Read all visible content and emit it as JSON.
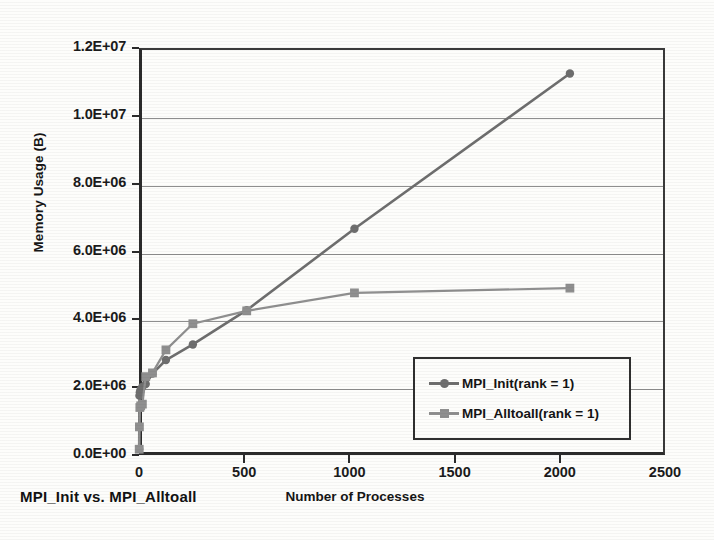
{
  "chart_data": {
    "type": "line",
    "title": "MPI_Init vs. MPI_Alltoall",
    "xlabel": "Number of Processes",
    "ylabel": "Memory Usage (B)",
    "xlim": [
      0,
      2500
    ],
    "ylim": [
      0,
      12000000
    ],
    "grid": true,
    "legend_position": "inside lower-right",
    "xticks": [
      0,
      500,
      1000,
      1500,
      2000,
      2500
    ],
    "xtick_labels": [
      "0",
      "500",
      "1000",
      "1500",
      "2000",
      "2500"
    ],
    "yticks": [
      0,
      2000000,
      4000000,
      6000000,
      8000000,
      10000000,
      12000000
    ],
    "ytick_labels": [
      "0.0E+00",
      "2.0E+06",
      "4.0E+06",
      "6.0E+06",
      "8.0E+06",
      "1.0E+07",
      "1.2E+07"
    ],
    "series": [
      {
        "name": "MPI_Init(rank = 1)",
        "color": "#6e6e6e",
        "marker": "circle",
        "x": [
          1,
          2,
          4,
          8,
          16,
          32,
          64,
          128,
          256,
          512,
          1024,
          2048
        ],
        "values": [
          180000,
          1750000,
          1850000,
          1930000,
          2010000,
          2090000,
          2400000,
          2800000,
          3260000,
          4270000,
          6670000,
          11250000
        ]
      },
      {
        "name": "MPI_Alltoall(rank = 1)",
        "color": "#8f8f8f",
        "marker": "square",
        "x": [
          1,
          2,
          4,
          8,
          16,
          32,
          64,
          128,
          256,
          512,
          1024,
          2048
        ],
        "values": [
          170000,
          830000,
          1400000,
          1450000,
          1500000,
          2310000,
          2420000,
          3100000,
          3870000,
          4250000,
          4780000,
          4920000
        ]
      }
    ]
  },
  "figure": {
    "title": "MPI_Init vs. MPI_Alltoall",
    "x_axis_title": "Number of Processes",
    "y_axis_title": "Memory Usage (B)"
  },
  "legend": {
    "entries": [
      {
        "label": "MPI_Init(rank = 1)",
        "color": "#6e6e6e",
        "marker": "circle"
      },
      {
        "label": "MPI_Alltoall(rank = 1)",
        "color": "#8f8f8f",
        "marker": "square"
      }
    ]
  }
}
